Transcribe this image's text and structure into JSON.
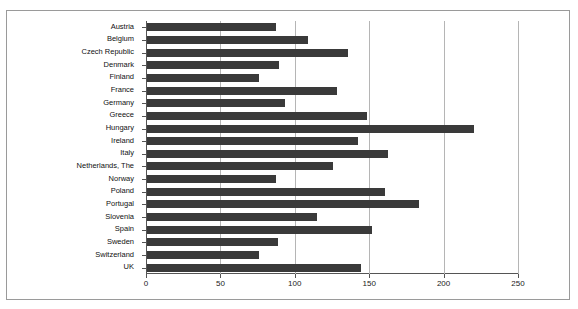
{
  "chart_data": {
    "type": "bar",
    "orientation": "horizontal",
    "title": "",
    "subtitle": "",
    "xlabel": "",
    "ylabel": "",
    "xlim": [
      0,
      250
    ],
    "ylim": null,
    "grid": true,
    "legend": null,
    "legend_position": "none",
    "xticks": [
      0,
      50,
      100,
      150,
      200,
      250
    ],
    "xtick_labels": [
      "0",
      "50",
      "100",
      "150",
      "200",
      "250"
    ],
    "bar_color": "#3a3a3a",
    "gridline_color": "#b5b5b5",
    "axis_color": "#555555",
    "frame_color": "#9a9a9a",
    "background": "#ffffff",
    "categories": [
      "Austria",
      "Belgium",
      "Czech Republic",
      "Denmark",
      "Finland",
      "France",
      "Germany",
      "Greece",
      "Hungary",
      "Ireland",
      "Italy",
      "Netherlands, The",
      "Norway",
      "Poland",
      "Portugal",
      "Slovenia",
      "Spain",
      "Sweden",
      "Switzerland",
      "UK"
    ],
    "values": [
      87,
      108,
      135,
      89,
      75,
      128,
      93,
      148,
      220,
      142,
      162,
      125,
      87,
      160,
      183,
      114,
      151,
      88,
      75,
      144
    ]
  }
}
